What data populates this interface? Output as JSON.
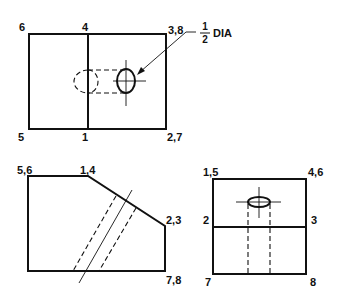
{
  "views": {
    "top": {
      "labels": {
        "top_left": "6",
        "top_mid": "4",
        "top_right": "3,8",
        "bottom_left": "5",
        "bottom_mid": "1",
        "bottom_right": "2,7"
      },
      "callout": {
        "numerator": "1",
        "denominator": "2",
        "unit": "DIA"
      }
    },
    "front": {
      "labels": {
        "top_left": "5,6",
        "top_mid": "1,4",
        "right_mid": "2,3",
        "bottom_right": "7,8"
      }
    },
    "side": {
      "labels": {
        "top_left": "1,5",
        "top_right": "4,6",
        "mid_left": "2",
        "mid_right": "3",
        "bottom_left": "7",
        "bottom_right": "8"
      }
    }
  }
}
